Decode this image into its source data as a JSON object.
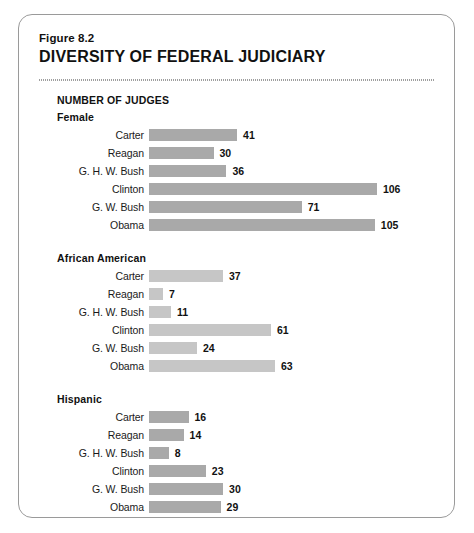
{
  "figure": {
    "label": "Figure 8.2",
    "title": "DIVERSITY OF FEDERAL JUDICIARY",
    "axis_heading": "NUMBER OF JUDGES"
  },
  "colors": {
    "bar_dark": "#a9a9a9",
    "bar_light": "#c6c6c6",
    "card_border": "#9a9a9a",
    "text": "#111111",
    "background": "#ffffff"
  },
  "chart_data": {
    "type": "bar",
    "title": "DIVERSITY OF FEDERAL JUDICIARY",
    "subtitle": "Figure 8.2",
    "xlabel": "NUMBER OF JUDGES",
    "ylabel": "",
    "orientation": "horizontal",
    "grid": false,
    "legend": "none",
    "categories": [
      "Carter",
      "Reagan",
      "G. H. W. Bush",
      "Clinton",
      "G. W. Bush",
      "Obama"
    ],
    "panels": [
      {
        "name": "Female",
        "values": [
          41,
          30,
          36,
          106,
          71,
          105
        ],
        "xlim": [
          0,
          106
        ],
        "px_per_unit": 2.15,
        "bar_color": "#a9a9a9"
      },
      {
        "name": "African American",
        "values": [
          37,
          7,
          11,
          61,
          24,
          63
        ],
        "xlim": [
          0,
          63
        ],
        "px_per_unit": 2.0,
        "bar_color": "#c6c6c6"
      },
      {
        "name": "Hispanic",
        "values": [
          16,
          14,
          8,
          23,
          30,
          29
        ],
        "xlim": [
          0,
          30
        ],
        "px_per_unit": 2.47,
        "bar_color": "#a9a9a9"
      }
    ],
    "series": [
      {
        "name": "Female",
        "values": [
          41,
          30,
          36,
          106,
          71,
          105
        ]
      },
      {
        "name": "African American",
        "values": [
          37,
          7,
          11,
          61,
          24,
          63
        ]
      },
      {
        "name": "Hispanic",
        "values": [
          16,
          14,
          8,
          23,
          30,
          29
        ]
      }
    ]
  }
}
